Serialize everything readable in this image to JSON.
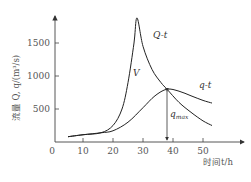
{
  "chart_data": {
    "type": "line",
    "title": "",
    "xlabel": "时间t/h",
    "ylabel": "流量 Q, q/(m³/s)",
    "xlim": [
      0,
      60
    ],
    "ylim": [
      0,
      2000
    ],
    "x_ticks": [
      0,
      10,
      20,
      30,
      40,
      50
    ],
    "y_ticks": [
      500,
      1000,
      1500
    ],
    "grid": false,
    "legend": "inline labels",
    "series": [
      {
        "name": "Q-t",
        "x": [
          5,
          10,
          16,
          20,
          23,
          25,
          27,
          28,
          30,
          33,
          36,
          38,
          42,
          46,
          50,
          53
        ],
        "values": [
          80,
          110,
          140,
          250,
          500,
          900,
          1500,
          1880,
          1450,
          1100,
          900,
          800,
          600,
          450,
          320,
          250
        ]
      },
      {
        "name": "q-t",
        "x": [
          5,
          10,
          16,
          20,
          25,
          30,
          34,
          38,
          42,
          46,
          50,
          53
        ],
        "values": [
          80,
          110,
          140,
          170,
          300,
          520,
          700,
          800,
          770,
          700,
          630,
          590
        ]
      }
    ],
    "annotations": [
      {
        "text": "Q-t",
        "x": 32,
        "y": 1700
      },
      {
        "text": "V",
        "x": 27,
        "y": 900
      },
      {
        "text": "q-t",
        "x": 47,
        "y": 850
      },
      {
        "text": "q_max",
        "x": 38,
        "y": 400,
        "note": "vertical double arrow from x-axis to peak of q-t at t≈38, q≈800"
      }
    ]
  },
  "labels": {
    "y_axis_title": "流量 Q, q/(m³/s)",
    "x_axis_title": "时间t/h",
    "origin": "0",
    "x_ticks": [
      "10",
      "20",
      "30",
      "40",
      "50"
    ],
    "y_ticks": [
      "500",
      "1000",
      "1500"
    ],
    "curve_Qt": "Q-t",
    "curve_qt": "q-t",
    "area_V": "V",
    "qmax_main": "q",
    "qmax_sub": "max"
  }
}
